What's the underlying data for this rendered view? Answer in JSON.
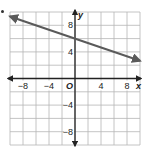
{
  "chart_data": {
    "type": "line",
    "title": "",
    "xlabel": "x",
    "ylabel": "y",
    "origin_label": "O",
    "xlim": [
      -10,
      10
    ],
    "ylim": [
      -10,
      10
    ],
    "grid": true,
    "grid_step": 2,
    "x_tick_labels": [
      "-8",
      "-4",
      "4",
      "8"
    ],
    "y_tick_labels": [
      "8",
      "4",
      "-4",
      "-8"
    ],
    "x_ticks": [
      -8,
      -4,
      4,
      8
    ],
    "y_ticks": [
      8,
      4,
      -4,
      -8
    ],
    "series": [
      {
        "name": "line",
        "equation": "y = -x/3 + 6",
        "x": [
          -10,
          0,
          10
        ],
        "y": [
          9.33,
          6,
          2.67
        ],
        "arrows": "both",
        "color": "#555555"
      }
    ],
    "legend": "none"
  },
  "colors": {
    "grid": "#b5b5b5",
    "axis": "#222222",
    "line": "#5a5a5a",
    "text": "#222222"
  }
}
